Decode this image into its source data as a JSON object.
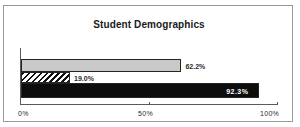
{
  "chart_data": {
    "type": "bar",
    "orientation": "horizontal",
    "title": "Student Demographics",
    "xlabel": "",
    "ylabel": "",
    "xlim": [
      0,
      100
    ],
    "grid": false,
    "legend": "none",
    "categories": [
      "",
      "",
      ""
    ],
    "values": [
      62.2,
      19.0,
      92.3
    ],
    "value_labels": [
      "62.2%",
      "19.0%",
      "92.3%"
    ],
    "series": [
      {
        "name": "bar-1",
        "value": 62.2,
        "label": "62.2%",
        "fill": "solid-light-gray",
        "color": "#c9c9c9",
        "label_position": "outside",
        "label_color": "#2a2a2a"
      },
      {
        "name": "bar-2",
        "value": 19.0,
        "label": "19.0%",
        "fill": "diagonal-hatch",
        "color": "#111111",
        "label_position": "outside",
        "label_color": "#2a2a2a"
      },
      {
        "name": "bar-3",
        "value": 92.3,
        "label": "92.3%",
        "fill": "solid-black",
        "color": "#0d0d0d",
        "label_position": "inside-right",
        "label_color": "#ffffff"
      }
    ],
    "xticks": [
      0,
      50,
      100
    ],
    "xticklabels": [
      "0%",
      "50%",
      "100%"
    ],
    "axis_color": "#5a5a5a",
    "border_color": "#9a9a9a",
    "background": "#ffffff"
  }
}
